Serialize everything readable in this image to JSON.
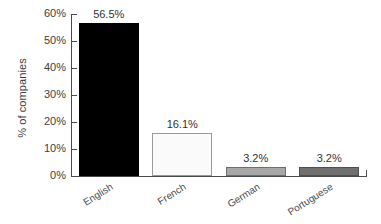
{
  "chart_data": {
    "type": "bar",
    "title": "",
    "subtitle": "",
    "xlabel": "",
    "ylabel": "% of companies",
    "categories": [
      "English",
      "French",
      "German",
      "Portuguese"
    ],
    "values": [
      56.5,
      16.1,
      3.2,
      3.2
    ],
    "value_labels": [
      "56.5%",
      "16.1%",
      "3.2%",
      "3.2%"
    ],
    "bar_colors": [
      "#000000",
      "#fafafa",
      "#a8a8a8",
      "#707070"
    ],
    "bar_border_colors": [
      "#000000",
      "#9a9a9a",
      "#6e6e6e",
      "#4f4f4f"
    ],
    "ylim": [
      0,
      60
    ],
    "ytick_values": [
      60,
      50,
      40,
      30,
      20,
      10,
      0
    ],
    "ytick_labels": [
      "60%",
      "50%",
      "40%",
      "30%",
      "20%",
      "10%",
      "0%"
    ],
    "grid": false,
    "legend": false,
    "legend_position": "none",
    "axis_color": "#4a4a4a",
    "background_color": "#ffffff"
  }
}
